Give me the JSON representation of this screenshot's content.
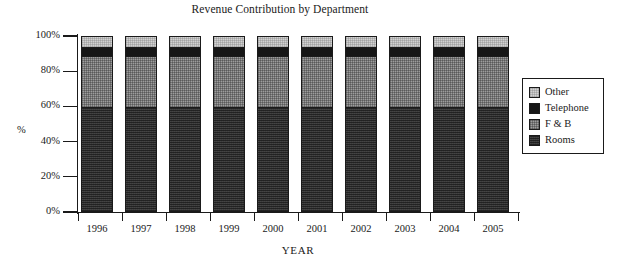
{
  "chart_data": {
    "type": "bar",
    "subtype": "stacked-100-percent",
    "title": "Revenue Contribution by Department",
    "xlabel": "YEAR",
    "ylabel": "%",
    "categories": [
      "1996",
      "1997",
      "1998",
      "1999",
      "2000",
      "2001",
      "2002",
      "2003",
      "2004",
      "2005"
    ],
    "ylim": [
      0,
      100
    ],
    "ytick_labels": [
      "0%",
      "20%",
      "40%",
      "60%",
      "80%",
      "100%"
    ],
    "ytick_values": [
      0,
      20,
      40,
      60,
      80,
      100
    ],
    "grid": false,
    "legend_position": "right",
    "stack_order_bottom_to_top": [
      "Rooms",
      "F & B",
      "Telephone",
      "Other"
    ],
    "series": [
      {
        "name": "Rooms",
        "color": "#3c3c3c",
        "values": [
          60,
          60,
          60,
          60,
          60,
          60,
          60,
          60,
          60,
          60
        ]
      },
      {
        "name": "F & B",
        "color": "#9d9d9d",
        "values": [
          29,
          29,
          29,
          29,
          29,
          29,
          29,
          29,
          29,
          29
        ]
      },
      {
        "name": "Telephone",
        "color": "#161616",
        "values": [
          5,
          5,
          5,
          5,
          5,
          5,
          5,
          5,
          5,
          5
        ]
      },
      {
        "name": "Other",
        "color": "#d2d2d2",
        "values": [
          6,
          6,
          6,
          6,
          6,
          6,
          6,
          6,
          6,
          6
        ]
      }
    ]
  },
  "legend": {
    "items": [
      {
        "label": "Other",
        "color": "#d2d2d2"
      },
      {
        "label": "Telephone",
        "color": "#161616"
      },
      {
        "label": "F & B",
        "color": "#9d9d9d"
      },
      {
        "label": "Rooms",
        "color": "#3c3c3c"
      }
    ]
  }
}
